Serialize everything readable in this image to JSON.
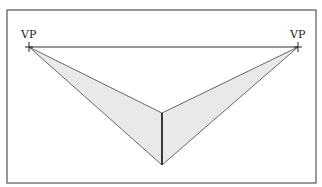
{
  "diagram": {
    "frame": {
      "x": 7,
      "y": 10,
      "width": 309,
      "height": 173,
      "stroke": "#555555"
    },
    "horizon_line": {
      "x1": 29,
      "y1": 47,
      "x2": 298,
      "y2": 47,
      "stroke": "#333333"
    },
    "vanishing_points": [
      {
        "label": "VP",
        "x": 29,
        "y": 47
      },
      {
        "label": "VP",
        "x": 298,
        "y": 47
      }
    ],
    "vertical_edge": {
      "x": 162,
      "top": 113,
      "bottom": 165,
      "stroke": "#222222"
    },
    "planes": [
      {
        "name": "left-plane",
        "points": [
          [
            29,
            47
          ],
          [
            162,
            113
          ],
          [
            162,
            165
          ]
        ],
        "fill": "#e9e9e9"
      },
      {
        "name": "right-plane",
        "points": [
          [
            298,
            47
          ],
          [
            162,
            113
          ],
          [
            162,
            165
          ]
        ],
        "fill": "#e9e9e9"
      }
    ],
    "fill_color": "#e9e9e9",
    "line_color": "#444444"
  }
}
